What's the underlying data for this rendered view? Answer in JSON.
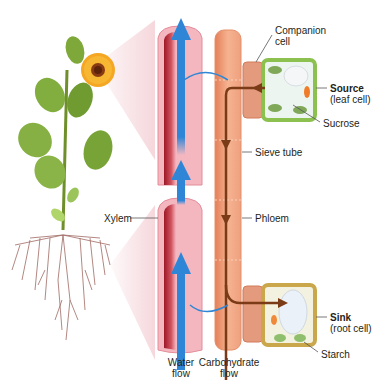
{
  "diagram": {
    "colors": {
      "water_arrow": "#2f86d6",
      "xylem_wall": "#f4b7c0",
      "xylem_inner": "#b8232f",
      "phloem": "#f0a27c",
      "carbohydrate_arrow": "#7a3b16",
      "source_cell_wall": "#8cc150",
      "sink_cell_wall": "#c9a74a",
      "companion_cell": "#e08c6e"
    },
    "labels": {
      "companion_cell_line1": "Companion",
      "companion_cell_line2": "cell",
      "source_title": "Source",
      "source_sub": "(leaf cell)",
      "sucrose": "Sucrose",
      "sieve_tube": "Sieve tube",
      "xylem": "Xylem",
      "phloem": "Phloem",
      "sink_title": "Sink",
      "sink_sub": "(root cell)",
      "starch": "Starch",
      "water_flow_line1": "Water",
      "water_flow_line2": "flow",
      "carb_flow_line1": "Carbohydrate",
      "carb_flow_line2": "flow"
    },
    "icons": {
      "plant": "sunflower-plant-icon",
      "roots": "root-system-icon"
    }
  }
}
